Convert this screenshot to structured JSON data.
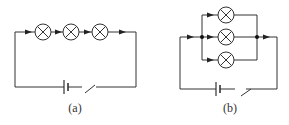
{
  "figure": {
    "circuits": [
      {
        "id": "a",
        "label": "(a)",
        "type": "series",
        "lamps": 3,
        "components": [
          "battery",
          "switch (open)",
          "3 lamps in series"
        ]
      },
      {
        "id": "b",
        "label": "(b)",
        "type": "parallel",
        "lamps": 3,
        "components": [
          "battery",
          "switch (open)",
          "3 lamps in parallel"
        ]
      }
    ]
  }
}
